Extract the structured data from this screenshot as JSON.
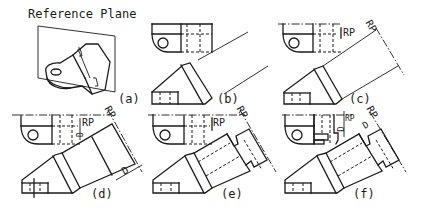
{
  "figure": {
    "title": "Reference Plane",
    "colors": {
      "line": "#1a1a1a",
      "background": "#ffffff"
    }
  },
  "panels": [
    {
      "id": "a",
      "label": "(a)",
      "content": "Pictorial of part with reference plane"
    },
    {
      "id": "b",
      "label": "(b)",
      "content": "Projection lines drawn perpendicular to inclined surface"
    },
    {
      "id": "c",
      "label": "(c)",
      "content": "Reference plane RP located in top view and auxiliary view",
      "annotations": [
        "RP",
        "RP"
      ]
    },
    {
      "id": "d",
      "label": "(d)",
      "content": "Depth D transferred from top view",
      "annotations": [
        "RP",
        "RP",
        "D",
        "D"
      ]
    },
    {
      "id": "e",
      "label": "(e)",
      "content": "Auxiliary view features completed",
      "annotations": [
        "RP",
        "RP"
      ]
    },
    {
      "id": "f",
      "label": "(f)",
      "content": "Final auxiliary view with depth dimension",
      "annotations": [
        "RP",
        "RP",
        "D",
        "D"
      ]
    }
  ],
  "annotations": {
    "rp": "RP",
    "d": "D"
  }
}
